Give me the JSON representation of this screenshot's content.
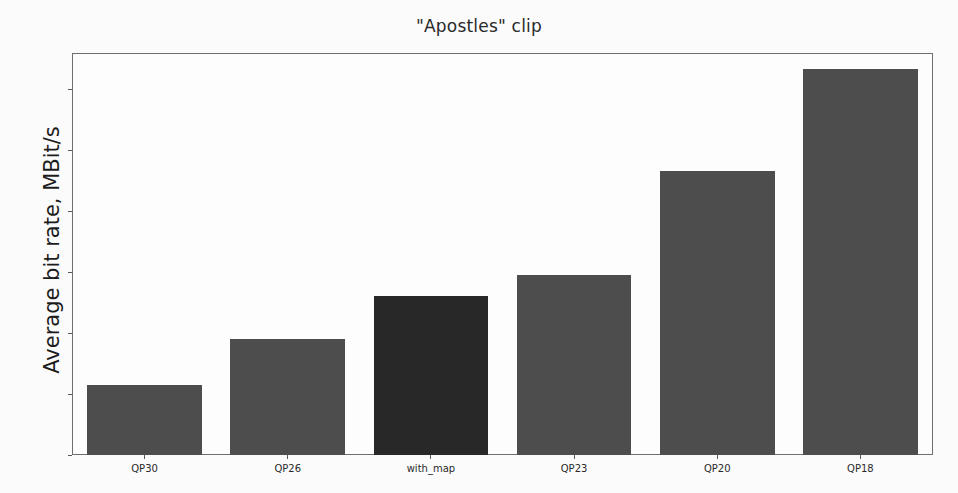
{
  "chart_data": {
    "type": "bar",
    "title": "\"Apostles\" clip",
    "xlabel": "",
    "ylabel": "Average bit rate, MBit/s",
    "categories": [
      "QP30",
      "QP26",
      "with_map",
      "QP23",
      "QP20",
      "QP18"
    ],
    "values": [
      23,
      38,
      52,
      59,
      93,
      126.5
    ],
    "ylim": [
      0,
      131.5
    ],
    "yticks": [
      0,
      20,
      40,
      60,
      80,
      100,
      120
    ],
    "ytick_labels": [
      "0",
      "20",
      "40",
      "60",
      "80",
      "100",
      "120"
    ],
    "grid": false,
    "legend": null,
    "bar_colors": [
      "#4d4d4d",
      "#4d4d4d",
      "#282828",
      "#4d4d4d",
      "#4d4d4d",
      "#4d4d4d"
    ],
    "highlight_category": "with_map",
    "highlight_color": "#282828",
    "default_bar_color": "#4d4d4d",
    "axis_color": "#6e6e6e",
    "background_color": "#fdfdfd"
  }
}
